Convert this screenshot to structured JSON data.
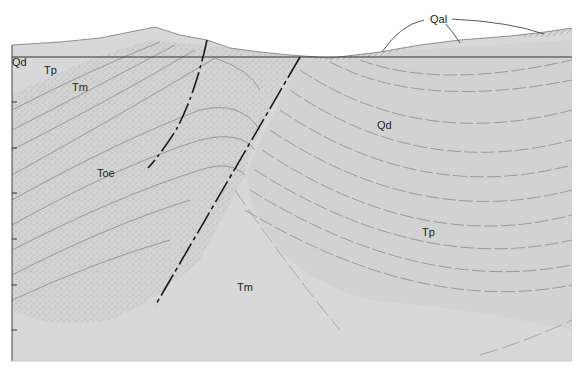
{
  "diagram": {
    "type": "geologic-cross-section",
    "colors": {
      "background": "#ffffff",
      "fill": "#d6d6d6",
      "stipple": "#9a9a9a",
      "bed_line": "#8a8a8a",
      "fault": "#1a1a1a",
      "datum": "#333333",
      "label": "#222222"
    },
    "units": [
      {
        "id": "Qd",
        "label": "Qd",
        "x": 12,
        "y": 66
      },
      {
        "id": "Tp-left",
        "label": "Tp",
        "x": 44,
        "y": 74
      },
      {
        "id": "Tm-left",
        "label": "Tm",
        "x": 72,
        "y": 91
      },
      {
        "id": "Toe",
        "label": "Toe",
        "x": 97,
        "y": 177
      },
      {
        "id": "Qd-right",
        "label": "Qd",
        "x": 377,
        "y": 129
      },
      {
        "id": "Tp-right",
        "label": "Tp",
        "x": 422,
        "y": 236
      },
      {
        "id": "Tm-bottom",
        "label": "Tm",
        "x": 237,
        "y": 291
      },
      {
        "id": "Qal",
        "label": "Qal",
        "x": 430,
        "y": 23
      }
    ],
    "datum_line_y": 57,
    "axis_ticks_y": [
      102,
      148,
      193,
      239,
      285,
      330
    ],
    "faults": [
      {
        "name": "fault-west",
        "from": [
          207,
          40
        ],
        "to": [
          148,
          168
        ]
      },
      {
        "name": "fault-east",
        "from": [
          300,
          57
        ],
        "to": [
          155,
          306
        ]
      }
    ]
  }
}
